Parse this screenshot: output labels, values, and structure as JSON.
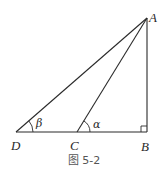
{
  "figure": {
    "caption": "图 5-2",
    "points": {
      "A": {
        "label": "A"
      },
      "B": {
        "label": "B"
      },
      "C": {
        "label": "C"
      },
      "D": {
        "label": "D"
      }
    },
    "angles": {
      "beta": {
        "label": "β",
        "vertex": "D"
      },
      "alpha": {
        "label": "α",
        "vertex": "C"
      }
    },
    "segments": [
      "AD",
      "AC",
      "AB",
      "DB"
    ],
    "right_angle_at": "B",
    "colors": {
      "stroke": "#2a2a2a",
      "background": "#ffffff"
    }
  }
}
